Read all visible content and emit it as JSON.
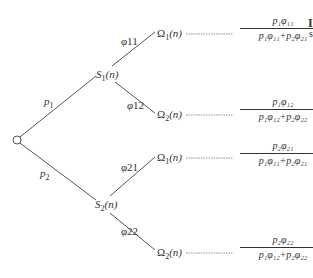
{
  "diagram": {
    "type": "probability-tree",
    "root": {
      "shape": "open-circle"
    },
    "branches_level1": [
      {
        "label": "p1",
        "target": "S1(n)"
      },
      {
        "label": "p2",
        "target": "S2(n)"
      }
    ],
    "states": [
      {
        "name": "S1(n)",
        "main": "S",
        "sub": "1",
        "arg": "(n)"
      },
      {
        "name": "S2(n)",
        "main": "S",
        "sub": "2",
        "arg": "(n)"
      }
    ],
    "branches_level2": [
      {
        "label": "φ11",
        "from": "S1(n)",
        "to": "Ω1(n)"
      },
      {
        "label": "φ12",
        "from": "S1(n)",
        "to": "Ω2(n)"
      },
      {
        "label": "φ21",
        "from": "S2(n)",
        "to": "Ω1(n)"
      },
      {
        "label": "φ22",
        "from": "S2(n)",
        "to": "Ω2(n)"
      }
    ],
    "leaves": [
      {
        "main": "Ω",
        "sub": "1",
        "arg": "(n)",
        "numerator": "p₁φ₁₁",
        "denominator": "p₁φ₁₁+p₂φ₂₁"
      },
      {
        "main": "Ω",
        "sub": "2",
        "arg": "(n)",
        "numerator": "p₁φ₁₂",
        "denominator": "p₁φ₁₂+p₂φ₂₂"
      },
      {
        "main": "Ω",
        "sub": "1",
        "arg": "(n)",
        "numerator": "p₂φ₂₁",
        "denominator": "p₁φ₁₁+p₂φ₂₁"
      },
      {
        "main": "Ω",
        "sub": "2",
        "arg": "(n)",
        "numerator": "p₂φ₂₂",
        "denominator": "p₁φ₁₂+p₂φ₂₂"
      }
    ],
    "labels": {
      "p1": "p",
      "p1_sub": "1",
      "p2": "p",
      "p2_sub": "2",
      "phi": "φ",
      "phi11": "11",
      "phi12": "12",
      "phi21": "21",
      "phi22": "22"
    },
    "cropped_edge_text": {
      "line1": "I",
      "line2": "s"
    }
  }
}
